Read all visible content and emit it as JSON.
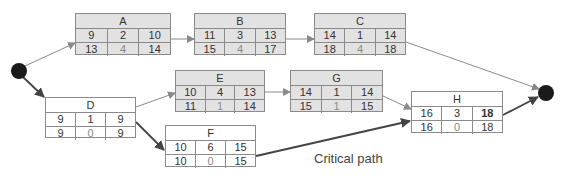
{
  "diagram": {
    "type": "activity-on-node network",
    "node_layout": "title; row1 = [earliest start, duration, earliest finish]; row2 = [latest start, slack, latest finish]",
    "nodes": {
      "A": {
        "title": "A",
        "es": "9",
        "dur": "2",
        "ef": "10",
        "ls": "13",
        "slack": "4",
        "lf": "14"
      },
      "B": {
        "title": "B",
        "es": "11",
        "dur": "3",
        "ef": "13",
        "ls": "15",
        "slack": "4",
        "lf": "17"
      },
      "C": {
        "title": "C",
        "es": "14",
        "dur": "1",
        "ef": "14",
        "ls": "18",
        "slack": "4",
        "lf": "18"
      },
      "D": {
        "title": "D",
        "es": "9",
        "dur": "1",
        "ef": "9",
        "ls": "9",
        "slack": "0",
        "lf": "9"
      },
      "E": {
        "title": "E",
        "es": "10",
        "dur": "4",
        "ef": "13",
        "ls": "11",
        "slack": "1",
        "lf": "14"
      },
      "G": {
        "title": "G",
        "es": "14",
        "dur": "1",
        "ef": "14",
        "ls": "15",
        "slack": "1",
        "lf": "15"
      },
      "F": {
        "title": "F",
        "es": "10",
        "dur": "6",
        "ef": "15",
        "ls": "10",
        "slack": "0",
        "lf": "15"
      },
      "H": {
        "title": "H",
        "es": "16",
        "dur": "3",
        "ef": "18",
        "ls": "16",
        "slack": "0",
        "lf": "18"
      }
    },
    "edges": [
      {
        "from": "start",
        "to": "A",
        "critical": false
      },
      {
        "from": "A",
        "to": "B",
        "critical": false
      },
      {
        "from": "B",
        "to": "C",
        "critical": false
      },
      {
        "from": "C",
        "to": "end",
        "critical": false
      },
      {
        "from": "start",
        "to": "D",
        "critical": true
      },
      {
        "from": "D",
        "to": "E",
        "critical": false
      },
      {
        "from": "E",
        "to": "G",
        "critical": false
      },
      {
        "from": "G",
        "to": "H",
        "critical": false
      },
      {
        "from": "D",
        "to": "F",
        "critical": true
      },
      {
        "from": "F",
        "to": "H",
        "critical": true
      },
      {
        "from": "H",
        "to": "end",
        "critical": true
      }
    ],
    "critical_path_label": "Critical path",
    "colors": {
      "shaded_node": "#e2e2e2",
      "critical_node": "#ffffff",
      "border": "#8a8a8a",
      "normal_edge": "#8a8a8a",
      "critical_edge": "#444444",
      "terminal_node": "#1a1a1a"
    }
  }
}
